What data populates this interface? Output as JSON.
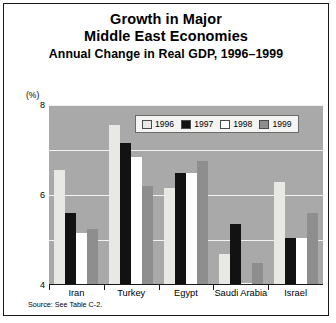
{
  "title": {
    "line1": "Growth in Major",
    "line2": "Middle East Economies",
    "line3": "Annual Change in Real GDP, 1996–1999"
  },
  "unit_label": "(%)",
  "source_note": "Source: See Table C-2.",
  "legend": {
    "entries": [
      {
        "label": "1996",
        "color": "#e8e8e4"
      },
      {
        "label": "1997",
        "color": "#121212"
      },
      {
        "label": "1998",
        "color": "#ffffff"
      },
      {
        "label": "1999",
        "color": "#8e8e8e"
      }
    ]
  },
  "chart_data": {
    "type": "bar",
    "title": "Growth in Major Middle East Economies",
    "subtitle": "Annual Change in Real GDP, 1996–1999",
    "xlabel": "",
    "ylabel": "(%)",
    "ylim": [
      0,
      8
    ],
    "yticks": [
      0,
      2,
      4,
      6,
      8
    ],
    "ytick_labels": [
      "0",
      "2",
      "4",
      "6",
      "8"
    ],
    "grid": true,
    "legend_position": "top-center",
    "categories": [
      "Iran",
      "Turkey",
      "Egypt",
      "Saudi Arabia",
      "Israel"
    ],
    "series": [
      {
        "name": "1996",
        "color": "#e8e8e4",
        "values": [
          5.1,
          7.1,
          4.3,
          1.4,
          4.6
        ]
      },
      {
        "name": "1997",
        "color": "#121212",
        "values": [
          3.2,
          6.3,
          5.0,
          2.7,
          2.1
        ]
      },
      {
        "name": "1998",
        "color": "#ffffff",
        "values": [
          2.3,
          5.7,
          5.0,
          0.1,
          2.1
        ]
      },
      {
        "name": "1999",
        "color": "#8e8e8e",
        "values": [
          2.5,
          4.4,
          5.5,
          1.0,
          3.2
        ]
      }
    ],
    "source": "Source: See Table C-2."
  }
}
